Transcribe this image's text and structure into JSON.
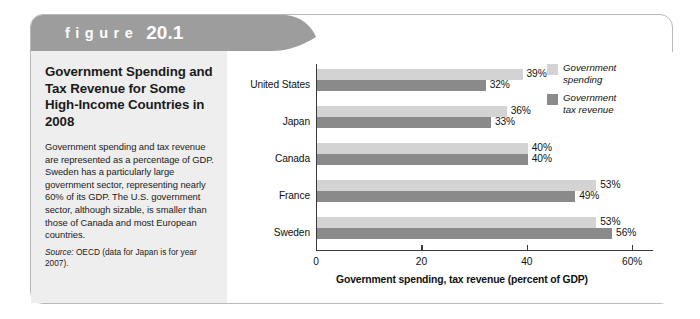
{
  "figure": {
    "banner_word": "figure",
    "banner_number": "20.1",
    "title": "Government Spending and Tax Revenue for Some High-Income Countries in 2008",
    "caption": "Government spending and tax revenue are represented as a percentage of GDP. Sweden has a particularly large government sector, representing nearly 60% of its GDP. The U.S. government sector, although sizable, is smaller than those of Canada and most European countries.",
    "source_label": "Source:",
    "source_text": "OECD (data for Japan is for year 2007)."
  },
  "colors": {
    "banner": "#9d9d9d",
    "panel_bg": "#ffffff",
    "left_block_bg": "#eeeeee",
    "spending": "#d3d3d3",
    "tax_revenue": "#8a8a8a",
    "axis": "#3a3a3a",
    "text": "#111111"
  },
  "chart_data": {
    "type": "bar",
    "orientation": "horizontal",
    "title": "Government Spending and Tax Revenue for Some High-Income Countries in 2008",
    "xlabel": "Government spending, tax revenue (percent of GDP)",
    "ylabel": "",
    "xlim": [
      0,
      64
    ],
    "xticks": [
      0,
      20,
      40,
      60
    ],
    "xtick_labels": [
      "0",
      "20",
      "40",
      "60%"
    ],
    "grid": false,
    "legend_position": "top-right",
    "categories": [
      "United States",
      "Japan",
      "Canada",
      "France",
      "Sweden"
    ],
    "series": [
      {
        "name": "Government spending",
        "color": "#d3d3d3",
        "values": [
          39,
          36,
          40,
          53,
          53
        ],
        "labels": [
          "39%",
          "36%",
          "40%",
          "53%",
          "53%"
        ]
      },
      {
        "name": "Government tax revenue",
        "color": "#8a8a8a",
        "values": [
          32,
          33,
          40,
          49,
          56
        ],
        "labels": [
          "32%",
          "33%",
          "40%",
          "49%",
          "56%"
        ]
      }
    ]
  },
  "legend": {
    "items": [
      {
        "label": "Government\nspending",
        "swatch": "spending"
      },
      {
        "label": "Government\ntax revenue",
        "swatch": "tax"
      }
    ]
  }
}
